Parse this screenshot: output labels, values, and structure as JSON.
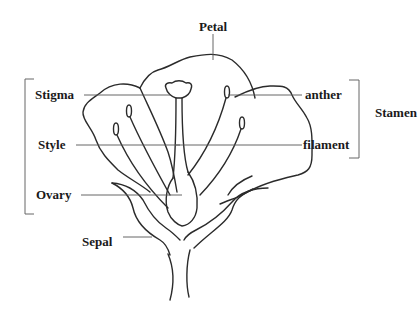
{
  "diagram": {
    "labels": {
      "petal": "Petal",
      "stigma": "Stigma",
      "style": "Style",
      "ovary": "Ovary",
      "sepal": "Sepal",
      "anther": "anther",
      "filament": "filament",
      "stamen": "Stamen"
    },
    "groups": {
      "pistil_bracket": [
        "Stigma",
        "Style",
        "Ovary"
      ],
      "stamen_bracket": [
        "anther",
        "filament"
      ]
    },
    "colors": {
      "line": "#2b2b2b",
      "text": "#1a1a1a",
      "background": "#ffffff"
    }
  }
}
